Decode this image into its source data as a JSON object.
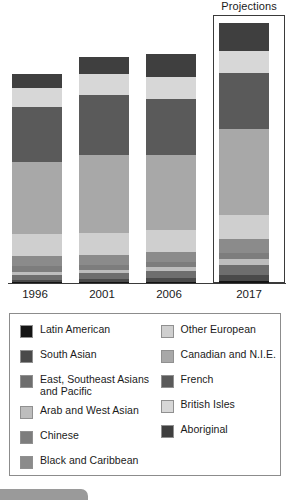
{
  "annotation": {
    "projections_label": "Projections"
  },
  "chart_data": {
    "type": "bar",
    "subtype": "stacked-100-percent",
    "title": "",
    "subtitle": "",
    "xlabel": "",
    "ylabel": "",
    "grid": false,
    "legend_position": "below",
    "categories": [
      "1996",
      "2001",
      "2006",
      "2017"
    ],
    "bar_total_heights_px": [
      209,
      226,
      229,
      260
    ],
    "annotations": [
      {
        "text": "Projections",
        "applies_to": "2017",
        "type": "box-callout"
      }
    ],
    "series": [
      {
        "name": "Aboriginal",
        "color": "#3f3f3f",
        "values": [
          14,
          17,
          23,
          28
        ]
      },
      {
        "name": "British Isles",
        "color": "#d7d7d7",
        "values": [
          19,
          21,
          22,
          22
        ]
      },
      {
        "name": "French",
        "color": "#5a5a5a",
        "values": [
          55,
          60,
          56,
          56
        ]
      },
      {
        "name": "Canadian and N.I.E.",
        "color": "#a8a8a8",
        "values": [
          72,
          78,
          75,
          86
        ]
      },
      {
        "name": "Other European",
        "color": "#cfcfcf",
        "values": [
          22,
          22,
          22,
          24
        ]
      },
      {
        "name": "Black and Caribbean",
        "color": "#8b8b8b",
        "values": [
          10,
          10,
          10,
          14
        ]
      },
      {
        "name": "Chinese",
        "color": "#7d7d7d",
        "values": [
          6,
          5,
          5,
          6
        ]
      },
      {
        "name": "Arab and West Asian",
        "color": "#bdbdbd",
        "values": [
          3,
          3,
          4,
          6
        ]
      },
      {
        "name": "East, Southeast Asians and Pacific",
        "color": "#6e6e6e",
        "values": [
          5,
          6,
          7,
          10
        ]
      },
      {
        "name": "South Asian",
        "color": "#4a4a4a",
        "values": [
          2,
          3,
          4,
          6
        ]
      },
      {
        "name": "Latin American",
        "color": "#141414",
        "values": [
          1,
          1,
          1,
          2
        ]
      }
    ]
  },
  "legend": {
    "left_column": [
      {
        "label": "Latin American",
        "color": "#141414"
      },
      {
        "label": "South Asian",
        "color": "#4a4a4a"
      },
      {
        "label": "East, Southeast Asians and Pacific",
        "color": "#6e6e6e"
      },
      {
        "label": "Arab and West Asian",
        "color": "#bdbdbd"
      },
      {
        "label": "Chinese",
        "color": "#7d7d7d"
      },
      {
        "label": "Black and Caribbean",
        "color": "#8b8b8b"
      }
    ],
    "right_column": [
      {
        "label": "Other European",
        "color": "#cfcfcf"
      },
      {
        "label": "Canadian and N.I.E.",
        "color": "#a8a8a8"
      },
      {
        "label": "French",
        "color": "#5a5a5a"
      },
      {
        "label": "British Isles",
        "color": "#d7d7d7"
      },
      {
        "label": "Aboriginal",
        "color": "#3f3f3f"
      }
    ]
  }
}
